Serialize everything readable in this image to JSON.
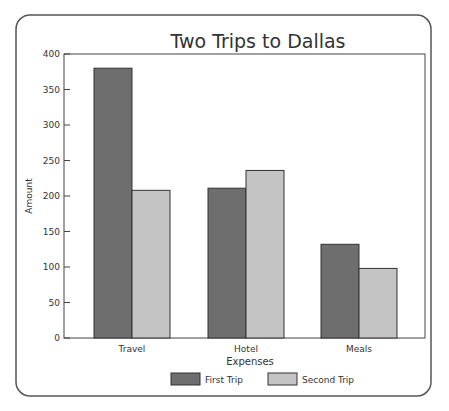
{
  "chart_data": {
    "type": "bar",
    "title": "Two Trips to Dallas",
    "xlabel": "Expenses",
    "ylabel": "Amount",
    "categories": [
      "Travel",
      "Hotel",
      "Meals"
    ],
    "series": [
      {
        "name": "First Trip",
        "values": [
          380,
          211,
          132
        ],
        "color": "#6e6e6e"
      },
      {
        "name": "Second Trip",
        "values": [
          208,
          236,
          98
        ],
        "color": "#c4c4c4"
      }
    ],
    "ylim": [
      0,
      400
    ],
    "yticks": [
      0,
      50,
      100,
      150,
      200,
      250,
      300,
      350,
      400
    ],
    "grid": false,
    "legend_position": "bottom"
  }
}
